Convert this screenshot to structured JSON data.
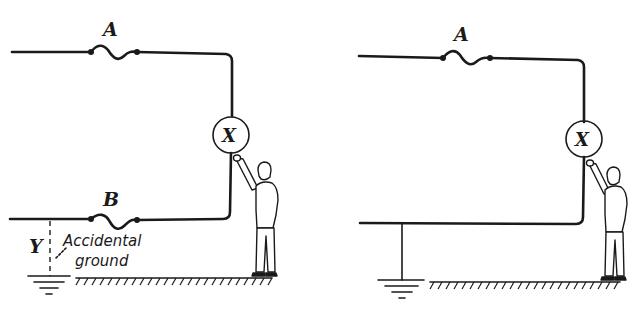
{
  "diagram": {
    "panels": [
      {
        "id": "left",
        "labels": {
          "fuse_top": "A",
          "fuse_bottom": "B",
          "load": "X",
          "ground_point": "Y",
          "annotation_line1": "Accidental",
          "annotation_line2": "ground"
        }
      },
      {
        "id": "right",
        "labels": {
          "fuse_top": "A",
          "load": "X"
        }
      }
    ],
    "colors": {
      "ink": "#1a1a1a",
      "background": "#ffffff"
    }
  }
}
